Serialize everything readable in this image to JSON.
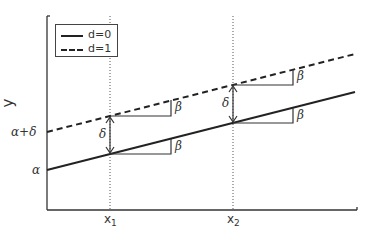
{
  "diagram": {
    "type": "dummy-variable regression (parallel lines)",
    "y_axis_label": "y",
    "y_ticks": [
      {
        "label": "α+δ",
        "y": 132
      },
      {
        "label": "α",
        "y": 170
      }
    ],
    "x_ticks": [
      {
        "label": "x",
        "sub": "1",
        "x": 110
      },
      {
        "label": "x",
        "sub": "2",
        "x": 233
      }
    ],
    "legend": {
      "items": [
        {
          "style": "solid",
          "label": "d=0"
        },
        {
          "style": "dashed",
          "label": "d=1"
        }
      ]
    },
    "lines": [
      {
        "name": "d=0",
        "style": "solid",
        "from": [
          47,
          170
        ],
        "to": [
          355,
          92
        ]
      },
      {
        "name": "d=1",
        "style": "dashed",
        "from": [
          47,
          132
        ],
        "to": [
          355,
          54
        ]
      }
    ],
    "annotations": {
      "slope_label": "β",
      "shift_label": "δ"
    },
    "colors": {
      "ink": "#222222",
      "text": "#333333",
      "background": "#ffffff"
    }
  }
}
